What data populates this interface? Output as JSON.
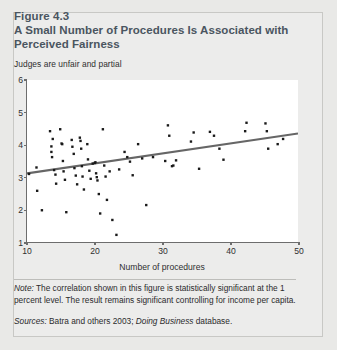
{
  "figure": {
    "number": "Figure 4.3",
    "title": "A Small Number of Procedures Is Associated with Perceived Fairness",
    "subtitle": "Judges are unfair and partial",
    "note_label": "Note:",
    "note_text": " The correlation shown in this figure is statistically significant at the 1 percent level. The result remains significant controlling for income per capita.",
    "sources_label": "Sources:",
    "sources_text_1": " Batra and others 2003; ",
    "sources_italic": "Doing Business",
    "sources_text_2": " database."
  },
  "colors": {
    "panel_background": "#ececeb",
    "page_background": "#e9e9e7",
    "title_text": "#4a5560",
    "body_text": "#2b2b2b",
    "plot_background": "#ffffff",
    "axis": "#6d6d6d",
    "marker": "#1a1a1a",
    "trendline": "#666666"
  },
  "chart_data": {
    "type": "scatter",
    "title": "A Small Number of Procedures Is Associated with Perceived Fairness",
    "subtitle": "Judges are unfair and partial",
    "xlabel": "Number of procedures",
    "ylabel": "",
    "xlim": [
      10,
      50
    ],
    "ylim": [
      1,
      6
    ],
    "xticks": [
      10,
      20,
      30,
      40,
      50
    ],
    "yticks": [
      1,
      2,
      3,
      4,
      5,
      6
    ],
    "grid": false,
    "legend": null,
    "marker_size_px": 2.4,
    "trendline": {
      "type": "linear",
      "x_start": 10,
      "y_start": 3.12,
      "x_end": 50,
      "y_end": 4.35,
      "color": "#666666",
      "width_px": 2.2
    },
    "points": [
      [
        10.3,
        3.1
      ],
      [
        11.4,
        3.3
      ],
      [
        11.5,
        2.58
      ],
      [
        12.2,
        1.98
      ],
      [
        13.4,
        4.42
      ],
      [
        13.6,
        3.95
      ],
      [
        13.6,
        3.78
      ],
      [
        13.7,
        3.62
      ],
      [
        13.8,
        4.18
      ],
      [
        14.0,
        3.22
      ],
      [
        14.2,
        3.08
      ],
      [
        14.3,
        2.8
      ],
      [
        14.9,
        4.48
      ],
      [
        15.1,
        4.04
      ],
      [
        15.2,
        4.02
      ],
      [
        15.3,
        3.5
      ],
      [
        15.4,
        3.18
      ],
      [
        15.6,
        2.92
      ],
      [
        15.8,
        1.92
      ],
      [
        16.6,
        4.15
      ],
      [
        16.7,
        3.94
      ],
      [
        16.9,
        3.72
      ],
      [
        17.0,
        3.28
      ],
      [
        17.2,
        3.05
      ],
      [
        17.4,
        2.78
      ],
      [
        17.8,
        4.22
      ],
      [
        17.9,
        4.12
      ],
      [
        18.0,
        3.88
      ],
      [
        18.1,
        3.34
      ],
      [
        18.2,
        3.02
      ],
      [
        18.4,
        2.62
      ],
      [
        18.9,
        4.02
      ],
      [
        19.0,
        3.55
      ],
      [
        19.2,
        3.2
      ],
      [
        19.4,
        2.95
      ],
      [
        19.7,
        3.42
      ],
      [
        20.0,
        3.44
      ],
      [
        20.1,
        3.46
      ],
      [
        20.2,
        3.12
      ],
      [
        20.3,
        3.0
      ],
      [
        20.4,
        2.9
      ],
      [
        20.6,
        2.48
      ],
      [
        20.8,
        1.88
      ],
      [
        21.2,
        4.48
      ],
      [
        21.4,
        3.36
      ],
      [
        21.6,
        3.02
      ],
      [
        21.8,
        2.3
      ],
      [
        22.2,
        3.18
      ],
      [
        22.6,
        1.68
      ],
      [
        23.2,
        1.22
      ],
      [
        23.6,
        3.24
      ],
      [
        24.4,
        3.78
      ],
      [
        24.8,
        3.62
      ],
      [
        25.2,
        3.48
      ],
      [
        25.6,
        3.06
      ],
      [
        26.4,
        4.02
      ],
      [
        27.0,
        3.58
      ],
      [
        27.6,
        2.14
      ],
      [
        28.6,
        3.62
      ],
      [
        30.4,
        3.5
      ],
      [
        30.8,
        4.6
      ],
      [
        31.0,
        4.28
      ],
      [
        31.4,
        3.34
      ],
      [
        31.6,
        3.36
      ],
      [
        32.0,
        3.52
      ],
      [
        34.2,
        4.1
      ],
      [
        34.6,
        4.38
      ],
      [
        35.4,
        3.26
      ],
      [
        37.0,
        4.4
      ],
      [
        37.6,
        4.28
      ],
      [
        38.4,
        3.88
      ],
      [
        39.0,
        3.54
      ],
      [
        42.2,
        4.42
      ],
      [
        42.4,
        4.68
      ],
      [
        45.2,
        4.66
      ],
      [
        45.4,
        4.42
      ],
      [
        45.6,
        3.88
      ],
      [
        47.0,
        4.02
      ],
      [
        47.8,
        4.18
      ]
    ]
  }
}
